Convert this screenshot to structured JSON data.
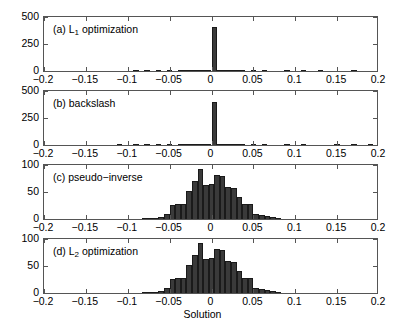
{
  "figure": {
    "xlabel": "Solution",
    "xticks": [
      "−0.2",
      "−0.15",
      "−0.1",
      "−0.05",
      "0",
      "0.05",
      "0.1",
      "0.15",
      "0.2"
    ],
    "xtick_values": [
      -0.2,
      -0.15,
      -0.1,
      -0.05,
      0,
      0.05,
      0.1,
      0.15,
      0.2
    ],
    "xlim": [
      -0.2,
      0.2
    ]
  },
  "chart_data": [
    {
      "type": "bar",
      "panel": "a",
      "title": "(a) L",
      "title_sub": "1",
      "title_rest": " optimization",
      "title_full": "(a) L1 optimization",
      "xlabel": "",
      "ylabel": "",
      "xlim": [
        -0.2,
        0.2
      ],
      "ylim": [
        0,
        500
      ],
      "yticks": [
        "0",
        "250",
        "500"
      ],
      "ytick_values": [
        0,
        250,
        500
      ],
      "grid": false,
      "bin_width": 0.00667,
      "x": [
        -0.09,
        -0.0767,
        -0.0633,
        -0.05,
        -0.0367,
        -0.03,
        -0.0233,
        -0.0167,
        -0.01,
        -0.00333,
        0.00333,
        0.01,
        0.0167,
        0.0233,
        0.03,
        0.0367,
        0.05,
        0.0633,
        0.09,
        0.11,
        0.13,
        0.17
      ],
      "values": [
        2,
        1,
        2,
        3,
        2,
        2,
        3,
        4,
        5,
        8,
        410,
        9,
        6,
        4,
        3,
        2,
        2,
        1,
        1,
        1,
        1,
        1
      ]
    },
    {
      "type": "bar",
      "panel": "b",
      "title": "(b) backslash",
      "title_sub": "",
      "title_rest": "",
      "title_full": "(b) backslash",
      "xlabel": "",
      "ylabel": "",
      "xlim": [
        -0.2,
        0.2
      ],
      "ylim": [
        0,
        500
      ],
      "yticks": [
        "0",
        "250",
        "500"
      ],
      "ytick_values": [
        0,
        250,
        500
      ],
      "grid": false,
      "bin_width": 0.00667,
      "x": [
        -0.11,
        -0.09,
        -0.0767,
        -0.0633,
        -0.05,
        -0.0367,
        -0.03,
        -0.0233,
        -0.0167,
        -0.01,
        -0.00333,
        0.00333,
        0.01,
        0.0167,
        0.0233,
        0.03,
        0.0367,
        0.05,
        0.0633,
        0.09,
        0.11,
        0.15,
        0.17,
        0.19
      ],
      "values": [
        1,
        2,
        2,
        2,
        3,
        3,
        2,
        3,
        4,
        5,
        7,
        400,
        8,
        5,
        4,
        3,
        3,
        6,
        2,
        2,
        1,
        1,
        2,
        1
      ]
    },
    {
      "type": "bar",
      "panel": "c",
      "title": "(c) pseudo−inverse",
      "title_sub": "",
      "title_rest": "",
      "title_full": "(c) pseudo-inverse",
      "xlabel": "",
      "ylabel": "",
      "xlim": [
        -0.2,
        0.2
      ],
      "ylim": [
        0,
        100
      ],
      "yticks": [
        "0",
        "50",
        "100"
      ],
      "ytick_values": [
        0,
        50,
        100
      ],
      "grid": false,
      "bin_width": 0.00667,
      "x": [
        -0.08,
        -0.0733,
        -0.0667,
        -0.06,
        -0.0533,
        -0.0467,
        -0.04,
        -0.0333,
        -0.0267,
        -0.02,
        -0.0133,
        -0.00667,
        0,
        0.00667,
        0.0133,
        0.02,
        0.0267,
        0.0333,
        0.04,
        0.0467,
        0.0533,
        0.06,
        0.0667,
        0.0733,
        0.08
      ],
      "values": [
        1,
        2,
        2,
        3,
        9,
        26,
        27,
        27,
        52,
        71,
        92,
        63,
        64,
        81,
        80,
        60,
        58,
        41,
        28,
        27,
        10,
        7,
        5,
        3,
        1
      ]
    },
    {
      "type": "bar",
      "panel": "d",
      "title": "(d) L",
      "title_sub": "2",
      "title_rest": " optimization",
      "title_full": "(d) L2 optimization",
      "xlabel": "Solution",
      "ylabel": "",
      "xlim": [
        -0.2,
        0.2
      ],
      "ylim": [
        0,
        100
      ],
      "yticks": [
        "0",
        "50",
        "100"
      ],
      "ytick_values": [
        0,
        50,
        100
      ],
      "grid": false,
      "bin_width": 0.00667,
      "x": [
        -0.08,
        -0.0733,
        -0.0667,
        -0.06,
        -0.0533,
        -0.0467,
        -0.04,
        -0.0333,
        -0.0267,
        -0.02,
        -0.0133,
        -0.00667,
        0,
        0.00667,
        0.0133,
        0.02,
        0.0267,
        0.0333,
        0.04,
        0.0467,
        0.0533,
        0.06,
        0.0667,
        0.0733,
        0.08
      ],
      "values": [
        1,
        2,
        2,
        3,
        9,
        26,
        27,
        27,
        52,
        71,
        92,
        63,
        64,
        81,
        80,
        60,
        58,
        41,
        28,
        27,
        10,
        7,
        5,
        3,
        1
      ]
    }
  ],
  "colors": {
    "bar_fill": "#3a3a3a",
    "bar_edge": "#1a1a1a",
    "axis": "#555555",
    "background": "#ffffff",
    "text": "#000000"
  }
}
